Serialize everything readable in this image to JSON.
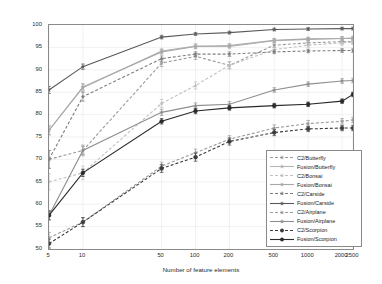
{
  "chart_data": {
    "type": "line",
    "title": "",
    "xlabel": "Number of feature elements",
    "ylabel": "Performance (Equilibrium point)",
    "xscale": "log",
    "x": [
      5,
      10,
      50,
      100,
      200,
      500,
      1000,
      2000,
      2500
    ],
    "xticklabels": [
      "5",
      "10",
      "50",
      "100",
      "200",
      "500",
      "1000",
      "2000",
      "2500"
    ],
    "yticks": [
      50,
      55,
      60,
      65,
      70,
      75,
      80,
      85,
      90,
      95,
      100
    ],
    "ylim": [
      50,
      100
    ],
    "grid": true,
    "legend_position": "lower right",
    "series": [
      {
        "name": "C2/Butterfly",
        "style": "dashed",
        "marker": "star",
        "color": "#9a9a9a",
        "values": [
          70.0,
          72.0,
          91.5,
          93.0,
          91.0,
          95.5,
          96.0,
          96.3,
          96.3
        ],
        "errors": [
          2.0,
          1.2,
          0.8,
          0.7,
          0.8,
          0.5,
          0.5,
          0.5,
          0.5
        ]
      },
      {
        "name": "Fusion/Butterfly",
        "style": "solid",
        "marker": "star",
        "color": "#b4b4b4",
        "values": [
          76.5,
          86.0,
          94.2,
          95.3,
          95.2,
          96.5,
          96.8,
          97.0,
          97.0
        ],
        "errors": [
          1.0,
          0.8,
          0.5,
          0.5,
          0.5,
          0.4,
          0.4,
          0.4,
          0.4
        ]
      },
      {
        "name": "C2/Bonsai",
        "style": "dashed",
        "marker": "star",
        "color": "#c0c0c0",
        "values": [
          65.0,
          67.0,
          82.5,
          86.5,
          91.0,
          94.5,
          95.5,
          96.0,
          96.2
        ],
        "errors": [
          1.8,
          1.5,
          0.9,
          0.8,
          0.7,
          0.5,
          0.5,
          0.5,
          0.5
        ]
      },
      {
        "name": "Fusion/Bonsai",
        "style": "solid",
        "marker": "star",
        "color": "#a8a8a8",
        "values": [
          76.5,
          86.2,
          94.0,
          95.2,
          95.4,
          96.6,
          96.9,
          97.0,
          97.1
        ],
        "errors": [
          1.0,
          0.7,
          0.5,
          0.5,
          0.4,
          0.4,
          0.4,
          0.4,
          0.4
        ]
      },
      {
        "name": "C2/Carside",
        "style": "dashed",
        "marker": "star",
        "color": "#7d7d7d",
        "values": [
          70.0,
          84.0,
          92.5,
          93.5,
          93.5,
          94.0,
          94.2,
          94.3,
          94.3
        ],
        "errors": [
          2.0,
          1.0,
          0.6,
          0.5,
          0.5,
          0.4,
          0.4,
          0.4,
          0.4
        ]
      },
      {
        "name": "Fusion/Carside",
        "style": "solid",
        "marker": "star",
        "color": "#5a5a5a",
        "values": [
          85.5,
          90.7,
          97.3,
          98.0,
          98.3,
          99.0,
          99.1,
          99.2,
          99.2
        ],
        "errors": [
          0.8,
          0.6,
          0.4,
          0.3,
          0.3,
          0.3,
          0.3,
          0.3,
          0.3
        ]
      },
      {
        "name": "C2/Airplane",
        "style": "dashed",
        "marker": "star",
        "color": "#9a9a9a",
        "values": [
          52.5,
          56.0,
          68.5,
          71.5,
          74.5,
          77.0,
          78.0,
          78.5,
          78.8
        ],
        "errors": [
          1.2,
          1.0,
          0.9,
          0.8,
          0.8,
          0.7,
          0.7,
          0.6,
          0.6
        ]
      },
      {
        "name": "Fusion/Airplane",
        "style": "solid",
        "marker": "star",
        "color": "#8f8f8f",
        "values": [
          57.5,
          72.0,
          80.5,
          82.0,
          82.3,
          85.5,
          86.8,
          87.5,
          87.6
        ],
        "errors": [
          1.0,
          0.9,
          0.7,
          0.6,
          0.6,
          0.5,
          0.5,
          0.5,
          0.5
        ]
      },
      {
        "name": "C2/Scorpion",
        "style": "dashed",
        "marker": "circle",
        "color": "#3c3c3c",
        "values": [
          51.2,
          56.0,
          68.0,
          70.5,
          74.0,
          76.0,
          76.8,
          77.0,
          77.0
        ],
        "errors": [
          1.0,
          1.0,
          0.9,
          0.9,
          0.8,
          0.7,
          0.6,
          0.6,
          0.6
        ]
      },
      {
        "name": "Fusion/Scorpion",
        "style": "solid",
        "marker": "circle",
        "color": "#2a2a2a",
        "values": [
          57.5,
          67.0,
          78.5,
          80.8,
          81.5,
          82.0,
          82.3,
          83.0,
          84.5
        ],
        "errors": [
          1.0,
          0.8,
          0.6,
          0.6,
          0.5,
          0.5,
          0.5,
          0.5,
          0.5
        ]
      }
    ]
  }
}
